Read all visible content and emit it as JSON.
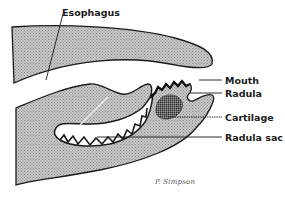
{
  "diagram": {
    "type": "anatomical cross-section",
    "labels": [
      {
        "id": "esophagus",
        "text": "Esophagus"
      },
      {
        "id": "mouth",
        "text": "Mouth"
      },
      {
        "id": "radula",
        "text": "Radula"
      },
      {
        "id": "cartilage",
        "text": "Cartilage"
      },
      {
        "id": "radula_sac",
        "text": "Radula sac"
      }
    ],
    "signature": "P. Simpson",
    "colors": {
      "tissue_fill": "#bdbdbd",
      "outline": "#1a1a1a",
      "cartilage_fill": "#555555",
      "background": "#ffffff"
    }
  }
}
